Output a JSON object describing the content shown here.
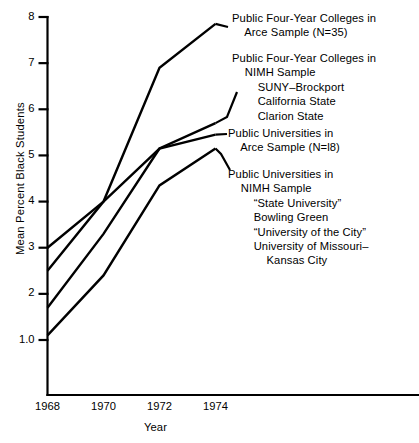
{
  "chart_data": {
    "type": "line",
    "title": "",
    "xlabel": "Year",
    "ylabel": "Mean Percent Black Students",
    "x": [
      1968,
      1970,
      1972,
      1974
    ],
    "xticklabels": [
      "1968",
      "1970",
      "1972",
      "1974"
    ],
    "yticklabels": [
      "1.0",
      "2",
      "3",
      "4",
      "5",
      "6",
      "7",
      "8"
    ],
    "ytickvalues": [
      1.0,
      2,
      3,
      4,
      5,
      6,
      7,
      8
    ],
    "xlim": [
      1968,
      1974
    ],
    "ylim": [
      1.0,
      8
    ],
    "grid": false,
    "legend_position": "right-inline-annotations",
    "series": [
      {
        "name": "Public Four-Year Colleges in Arce Sample (N=35)",
        "values": [
          2.5,
          4.0,
          6.9,
          7.85
        ]
      },
      {
        "name": "Public Four-Year Colleges in NIMH Sample",
        "values": [
          1.7,
          3.3,
          5.15,
          5.7
        ]
      },
      {
        "name": "Public Universities in Arce Sample (N=18)",
        "values": [
          3.0,
          4.0,
          5.15,
          5.45
        ]
      },
      {
        "name": "Public Universities in NIMH Sample",
        "values": [
          1.1,
          2.4,
          4.35,
          5.15
        ]
      }
    ],
    "annotations": [
      {
        "id": "annotation-arce-colleges",
        "lines": [
          "Public Four-Year Colleges in",
          "    Arce Sample (N=35)"
        ]
      },
      {
        "id": "annotation-nimh-colleges",
        "lines": [
          "Public Four-Year Colleges in",
          "    NIMH Sample",
          "        SUNY–Brockport",
          "        California State",
          "        Clarion State"
        ]
      },
      {
        "id": "annotation-arce-universities",
        "lines": [
          "Public Universities in",
          "    Arce Sample (N=l8)"
        ]
      },
      {
        "id": "annotation-nimh-universities",
        "lines": [
          "Public Universities in",
          "    NIMH Sample",
          "        “State University”",
          "        Bowling Green",
          "        “University of the City”",
          "        University of Missouri–",
          "            Kansas City"
        ]
      }
    ]
  },
  "axes": {
    "x_title": "Year",
    "y_title": "Mean Percent Black Students",
    "x_ticks": [
      "1968",
      "1970",
      "1972",
      "1974"
    ],
    "y_ticks": [
      "8",
      "7",
      "6",
      "5",
      "4",
      "3",
      "2",
      "1.0"
    ]
  },
  "colors": {
    "line": "#000000",
    "axis": "#000000",
    "background": "#ffffff"
  }
}
